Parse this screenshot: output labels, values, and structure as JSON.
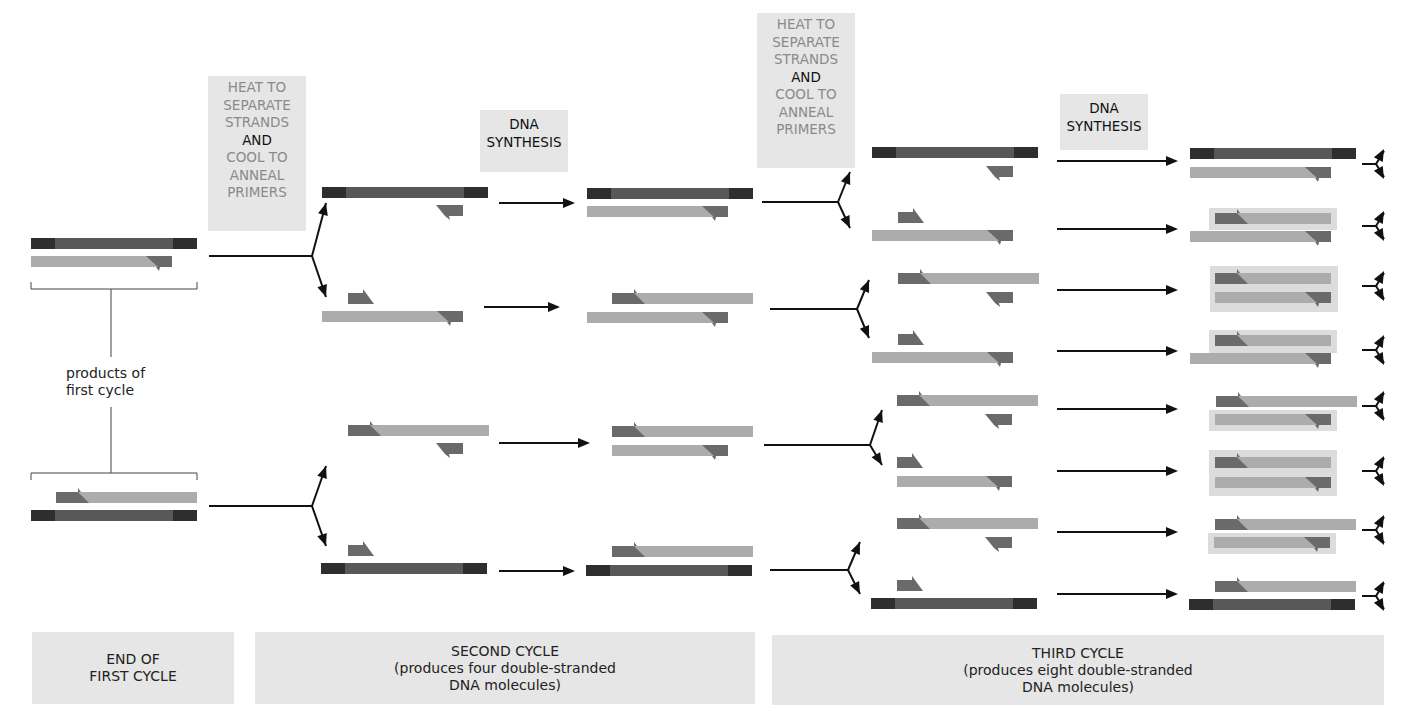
{
  "diagram": {
    "colors": {
      "template_dark": "#585858",
      "template_end": "#2e2e2e",
      "new_strand_light": "#acacac",
      "primer": "#6a6a6a",
      "highlight_box": "#dcdcdc",
      "arrow": "#111111",
      "label_box": "#e6e6e6"
    }
  },
  "step_labels": {
    "heat_cool_1": {
      "lines_grey_top": [
        "HEAT TO",
        "SEPARATE",
        "STRANDS"
      ],
      "line_and": "AND",
      "lines_grey_bottom": [
        "COOL TO",
        "ANNEAL",
        "PRIMERS"
      ]
    },
    "synthesis_1": {
      "lines": [
        "DNA",
        "SYNTHESIS"
      ]
    },
    "heat_cool_2": {
      "lines_grey_top": [
        "HEAT TO",
        "SEPARATE",
        "STRANDS"
      ],
      "line_and": "AND",
      "lines_grey_bottom": [
        "COOL TO",
        "ANNEAL",
        "PRIMERS"
      ]
    },
    "synthesis_2": {
      "lines": [
        "DNA",
        "SYNTHESIS"
      ]
    }
  },
  "annotations": {
    "products_of_first_cycle": [
      "products of",
      "first cycle"
    ]
  },
  "footer": {
    "first": [
      "END OF",
      "FIRST CYCLE"
    ],
    "second": [
      "SECOND CYCLE",
      "(produces four double-stranded",
      "DNA molecules)"
    ],
    "third": [
      "THIRD CYCLE",
      "(produces eight double-stranded",
      "DNA molecules)"
    ]
  },
  "cycles": {
    "first_cycle_products": 2,
    "second_cycle_products": 4,
    "third_cycle_products": 8
  },
  "icons": {
    "arrow": "right-arrow-icon",
    "split": "split-arrow-icon"
  }
}
